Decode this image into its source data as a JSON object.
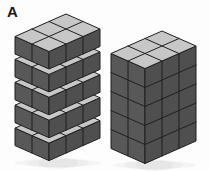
{
  "figure": {
    "panel_label": "A",
    "background_color": "#fdfdfd",
    "canvas": {
      "width": 209,
      "height": 171
    },
    "colors": {
      "top_face": "#c7c7c7",
      "left_face": "#585858",
      "right_face": "#4f4f4f",
      "outline": "#1f1f1f",
      "shadow": "#9a9a9a"
    },
    "projection": {
      "dx": 17,
      "dy": 7.5
    },
    "stacks": [
      {
        "name": "separated-layer-stack",
        "description": "Five 3x2 cube layers stacked with gaps between layers",
        "origin": {
          "x": 66,
          "y": 14
        },
        "depth_cubes": 3,
        "width_cubes": 2,
        "slabs": 5,
        "rows_per_slab": 1,
        "row_height": 17.5,
        "slab_gap": 5.4,
        "total_cubes": 30,
        "shadow": {
          "cx": 58,
          "cy": 163,
          "rx": 44,
          "ry": 4
        }
      },
      {
        "name": "compact-stack",
        "description": "Solid 3x2x5 cube block",
        "origin": {
          "x": 162,
          "y": 31
        },
        "depth_cubes": 3,
        "width_cubes": 2,
        "slabs": 1,
        "rows_per_slab": 5,
        "row_height": 19,
        "slab_gap": 0,
        "total_cubes": 30,
        "shadow": {
          "cx": 154,
          "cy": 165,
          "rx": 42,
          "ry": 4
        }
      }
    ]
  }
}
